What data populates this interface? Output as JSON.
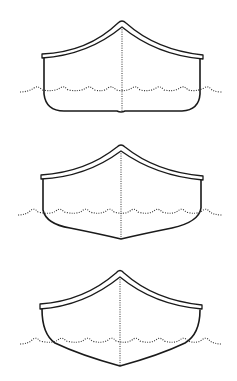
{
  "figure": {
    "colors": {
      "line": "#1a1a1a",
      "background": "#ffffff"
    },
    "canoes": [
      {
        "name": "flat-bottom-hull",
        "shape": "flat bottom with hard chines"
      },
      {
        "name": "shallow-v-hull",
        "shape": "shallow arch / soft V bottom"
      },
      {
        "name": "v-hull",
        "shape": "pronounced V bottom"
      }
    ]
  }
}
